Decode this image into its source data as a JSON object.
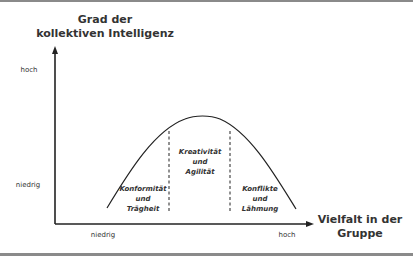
{
  "diagram": {
    "y_axis": {
      "title_line1": "Grad der",
      "title_line2": "kollektiven Intelligenz",
      "tick_high": "hoch",
      "tick_low": "niedrig"
    },
    "x_axis": {
      "title_line1": "Vielfalt in der",
      "title_line2": "Gruppe",
      "tick_low": "niedrig",
      "tick_high": "hoch"
    },
    "regions": [
      {
        "line1": "Konformität",
        "line2": "und",
        "line3": "Trägheit"
      },
      {
        "line1": "Kreativität",
        "line2": "und",
        "line3": "Agilität"
      },
      {
        "line1": "Konflikte",
        "line2": "und",
        "line3": "Lähmung"
      }
    ],
    "curve": "inverted-U (bell) curve",
    "colors": {
      "line": "#222222",
      "border": "#8a8a8a",
      "background": "#ffffff"
    }
  }
}
